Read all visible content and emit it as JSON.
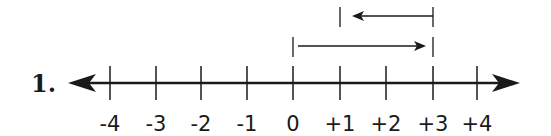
{
  "problem": {
    "label": "1."
  },
  "number_line": {
    "ticks": [
      {
        "value": -4,
        "label": "-4",
        "x": 110
      },
      {
        "value": -3,
        "label": "-3",
        "x": 156
      },
      {
        "value": -2,
        "label": "-2",
        "x": 201
      },
      {
        "value": -1,
        "label": "-1",
        "x": 247
      },
      {
        "value": 0,
        "label": "0",
        "x": 293
      },
      {
        "value": 1,
        "label": "+1",
        "x": 340
      },
      {
        "value": 2,
        "label": "+2",
        "x": 386
      },
      {
        "value": 3,
        "label": "+3",
        "x": 433
      },
      {
        "value": 4,
        "label": "+4",
        "x": 477
      }
    ]
  },
  "moves": [
    {
      "from": 0,
      "to": 3,
      "direction": "right"
    },
    {
      "from": 3,
      "to": 1,
      "direction": "left"
    }
  ],
  "colors": {
    "ink": "#1a1a1a"
  }
}
